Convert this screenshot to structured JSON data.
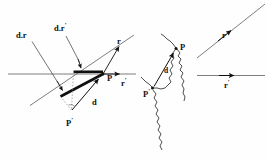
{
  "figure": {
    "background_color": "#fefefe",
    "ink_color": "#101010",
    "panels": [
      {
        "name": "left-panel",
        "description": "horizontal line and diagonal line crossing at point P with displacement vector d and projections"
      },
      {
        "name": "middle-panel",
        "description": "irregular wavy boundary curve with points P and P prime joined by vector d"
      },
      {
        "name": "right-panel",
        "description": "separated diagonal ray r and horizontal ray r prime"
      }
    ]
  },
  "labels": {
    "left": {
      "d_dot_r": "d.r",
      "d_dot_r_prime_base": "d.r",
      "d_dot_r_prime_mark": "′",
      "r": "r",
      "r_prime_base": "r",
      "r_prime_mark": "′",
      "P": "P",
      "P_prime_base": "P",
      "P_prime_mark": "′",
      "d": "d"
    },
    "middle": {
      "P": "P",
      "P_prime_base": "P",
      "P_prime_mark": "′",
      "d": "d"
    },
    "right": {
      "r": "r",
      "r_prime_base": "r",
      "r_prime_mark": "′"
    }
  },
  "geometry": {
    "left": {
      "horizontal_line": {
        "x1": 8,
        "y1": 74,
        "x2": 136,
        "y2": 74
      },
      "diagonal_line": {
        "x1": 30,
        "y1": 105,
        "x2": 133,
        "y2": 36
      },
      "point_P": {
        "x": 103,
        "y": 74
      },
      "point_P_prime": {
        "x": 72,
        "y": 113
      },
      "thick_horizontal_segment": {
        "x1": 74,
        "y1": 72,
        "x2": 103,
        "y2": 72
      },
      "thick_diagonal_segment": {
        "x1": 61,
        "y1": 96,
        "x2": 103,
        "y2": 74
      },
      "vector_d": {
        "x1": 72,
        "y1": 110,
        "x2": 99,
        "y2": 79
      },
      "dashed_vertical": {
        "x1": 74,
        "y1": 72,
        "x2": 72,
        "y2": 110
      },
      "dashed_diagonal": {
        "x1": 61,
        "y1": 96,
        "x2": 72,
        "y2": 110
      },
      "leader_d_dot_r": {
        "x1": 32,
        "y1": 41,
        "x2": 61,
        "y2": 91
      },
      "leader_d_dot_r_prime": {
        "x1": 66,
        "y1": 36,
        "x2": 76,
        "y2": 68
      },
      "arrow_r_on_diagonal": {
        "x": 112,
        "y": 52
      },
      "arrow_r_prime_on_horizontal": {
        "x": 117,
        "y": 74
      }
    },
    "middle": {
      "point_P": {
        "x": 176,
        "y": 48
      },
      "point_P_prime": {
        "x": 152,
        "y": 88
      },
      "vector_d": {
        "x1": 154,
        "y1": 86,
        "x2": 173,
        "y2": 54
      }
    },
    "right": {
      "diagonal_line": {
        "x1": 198,
        "y1": 58,
        "x2": 264,
        "y2": 6
      },
      "horizontal_line": {
        "x1": 198,
        "y1": 76,
        "x2": 264,
        "y2": 76
      },
      "arrow_r": {
        "x": 229,
        "y": 25
      },
      "arrow_r_prime": {
        "x": 231,
        "y": 76
      }
    }
  }
}
